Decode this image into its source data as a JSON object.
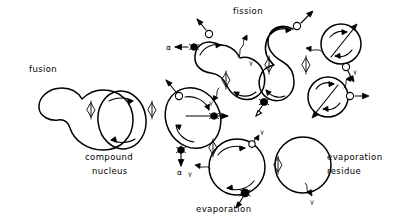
{
  "figure": {
    "kind": "nuclear-reaction-schematic",
    "background_color": "#ffffff",
    "ink_color": "#000000",
    "width": 401,
    "height": 221
  },
  "labels": {
    "fusion": "fusion",
    "fission": "fission",
    "compound_nucleus_line1": "compound",
    "compound_nucleus_line2": "nucleus",
    "evaporation": "evaporation",
    "evaporation_residue_line1": "evaporation",
    "evaporation_residue_line2": "residue"
  },
  "particles": {
    "alpha_symbol": "α",
    "gamma_symbol": "γ",
    "alpha_name": "alpha-particle",
    "neutron_name": "neutron",
    "gamma_name": "gamma-ray"
  },
  "particle_labels": [
    {
      "id": "alpha-left",
      "symbol": "α",
      "x": 166,
      "y": 49
    },
    {
      "id": "gamma-upper-right",
      "symbol": "γ",
      "x": 248,
      "y": 63
    },
    {
      "id": "gamma-lower-left",
      "symbol": "γ",
      "x": 189,
      "y": 172
    },
    {
      "id": "alpha-center-lower",
      "symbol": "α",
      "x": 176,
      "y": 176
    },
    {
      "id": "gamma-fission-lower",
      "symbol": "γ",
      "x": 210,
      "y": 103
    },
    {
      "id": "gamma-residue",
      "symbol": "γ",
      "x": 308,
      "y": 201
    },
    {
      "id": "gamma-fragment-right",
      "symbol": "γ",
      "x": 337,
      "y": 127
    },
    {
      "id": "gamma-evap-top",
      "symbol": "γ",
      "x": 240,
      "y": 130
    }
  ],
  "stages": [
    {
      "id": "fusion-shape",
      "name": "fusion-nucleus",
      "label": "fusion"
    },
    {
      "id": "compound-nucleus-shape",
      "name": "compound-nucleus",
      "label": "compound nucleus"
    },
    {
      "id": "excited-nucleus-shape",
      "name": "excited-rotating-nucleus",
      "label": ""
    },
    {
      "id": "fission-neck-1",
      "name": "fission-deforming-nucleus",
      "label": "fission"
    },
    {
      "id": "fission-neck-2",
      "name": "fission-scission-nucleus",
      "label": "fission"
    },
    {
      "id": "fission-fragment-upper",
      "name": "fission-fragment",
      "label": ""
    },
    {
      "id": "fission-fragment-lower",
      "name": "fission-fragment",
      "label": ""
    },
    {
      "id": "evaporating-nucleus",
      "name": "evaporating-nucleus",
      "label": "evaporation"
    },
    {
      "id": "residue-nucleus",
      "name": "evaporation-residue-nucleus",
      "label": "evaporation residue"
    }
  ],
  "transitions": [
    {
      "id": "t1",
      "from": "fusion-shape",
      "to": "compound-nucleus-shape",
      "glyph": "double-chevron"
    },
    {
      "id": "t2",
      "from": "compound-nucleus-shape",
      "to": "excited-nucleus-shape",
      "glyph": "double-chevron"
    },
    {
      "id": "t3",
      "from": "excited-nucleus-shape",
      "to": "fission-neck-1",
      "glyph": "double-chevron"
    },
    {
      "id": "t4",
      "from": "fission-neck-1",
      "to": "fission-neck-2",
      "glyph": "double-chevron"
    },
    {
      "id": "t5",
      "from": "fission-neck-2",
      "to": "fission-fragments",
      "glyph": "double-chevron"
    },
    {
      "id": "t6",
      "from": "evaporating-nucleus",
      "to": "residue-nucleus",
      "glyph": "double-chevron"
    }
  ]
}
